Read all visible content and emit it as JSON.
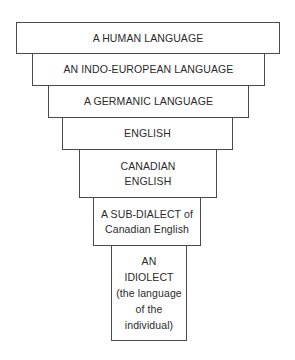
{
  "diagram": {
    "type": "inverted-pyramid hierarchy",
    "levels": [
      {
        "id": "human-language",
        "label": "A HUMAN LANGUAGE"
      },
      {
        "id": "indo-european-language",
        "label": "AN INDO-EUROPEAN LANGUAGE"
      },
      {
        "id": "germanic-language",
        "label": "A GERMANIC LANGUAGE"
      },
      {
        "id": "english",
        "label": "ENGLISH"
      },
      {
        "id": "canadian-english",
        "label": "CANADIAN\nENGLISH"
      },
      {
        "id": "sub-dialect",
        "label": "A SUB-DIALECT of\nCanadian English"
      },
      {
        "id": "idiolect",
        "label": "AN\nIDIOLECT\n(the language\nof the\nindividual)"
      }
    ]
  }
}
